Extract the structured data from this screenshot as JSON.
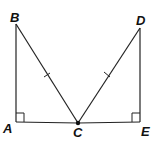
{
  "diagram": {
    "labels": {
      "A": "A",
      "B": "B",
      "C": "C",
      "D": "D",
      "E": "E"
    },
    "points": {
      "A": [
        16,
        122
      ],
      "B": [
        16,
        24
      ],
      "C": [
        78,
        123
      ],
      "D": [
        140,
        28
      ],
      "E": [
        140,
        122
      ]
    },
    "segments": [
      "AB",
      "AC",
      "BC",
      "CD",
      "CE",
      "DE"
    ],
    "congruent_marks": [
      "BC",
      "CD"
    ],
    "right_angles": [
      "A",
      "E"
    ],
    "colors": {
      "stroke": "#222222",
      "text": "#111111"
    }
  }
}
